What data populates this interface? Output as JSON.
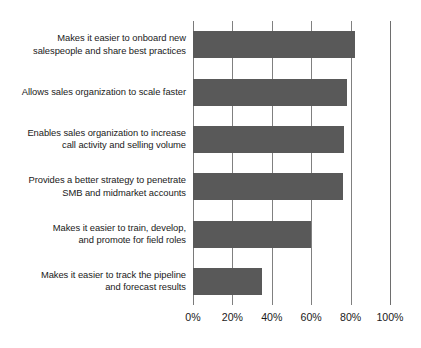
{
  "chart_data": {
    "type": "bar",
    "orientation": "horizontal",
    "title": "",
    "subtitle": "",
    "xlabel": "",
    "ylabel": "",
    "xlim": [
      0,
      100
    ],
    "grid": true,
    "legend": false,
    "legend_position": "none",
    "bar_color": "#595959",
    "gridline_color": "#808080",
    "text_color": "#1a1a1a",
    "background_color": "#ffffff",
    "tick_labels": [
      "0%",
      "20%",
      "40%",
      "60%",
      "80%",
      "100%"
    ],
    "tick_values": [
      0,
      20,
      40,
      60,
      80,
      100
    ],
    "categories": [
      "Makes it easier to onboard new salespeople and share best practices",
      "Allows sales organization to scale faster",
      "Enables sales organization to increase call activity and selling volume",
      "Provides a better strategy to penetrate SMB and midmarket accounts",
      "Makes it easier to train, develop, and promote for field roles",
      "Makes it easier to track the pipeline and forecast results"
    ],
    "category_lines": [
      [
        "Makes it easier to onboard new",
        "salespeople and share best practices"
      ],
      [
        "Allows sales organization to scale faster"
      ],
      [
        "Enables sales organization to increase",
        "call activity and selling volume"
      ],
      [
        "Provides a better strategy to penetrate",
        "SMB and midmarket accounts"
      ],
      [
        "Makes it easier to train, develop,",
        "and promote for field roles"
      ],
      [
        "Makes it easier to track the pipeline",
        "and forecast results"
      ]
    ],
    "values": [
      82,
      78,
      76.5,
      76,
      60,
      35
    ],
    "value_labels": [
      "82%",
      "78%",
      "77%",
      "76%",
      "60%",
      "35%"
    ]
  }
}
